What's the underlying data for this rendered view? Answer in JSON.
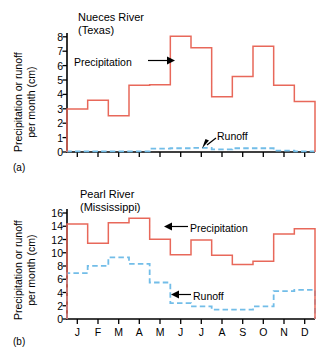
{
  "figure": {
    "panel_a_letter": "(a)",
    "panel_b_letter": "(b)"
  },
  "panel_a": {
    "title_line1": "Nueces River",
    "title_line2": "(Texas)",
    "ylabel_line1": "Precipitation or runoff",
    "ylabel_line2": "per month (cm)",
    "annotation_precipitation": "Precipitation",
    "annotation_runoff": "Runoff",
    "ytick_labels": [
      "0",
      "1",
      "2",
      "3",
      "4",
      "5",
      "6",
      "7",
      "8"
    ]
  },
  "panel_b": {
    "title_line1": "Pearl River",
    "title_line2": "(Mississippi)",
    "ylabel_line1": "Precipitation or runoff",
    "ylabel_line2": "per month (cm)",
    "annotation_precipitation": "Precipitation",
    "annotation_runoff": "Runoff",
    "ytick_labels": [
      "0",
      "2",
      "4",
      "6",
      "8",
      "10",
      "12",
      "14",
      "16"
    ],
    "xtick_labels": [
      "J",
      "F",
      "M",
      "A",
      "M",
      "J",
      "J",
      "A",
      "S",
      "O",
      "N",
      "D"
    ]
  },
  "colors": {
    "precipitation": "#e8685a",
    "runoff": "#72bde8",
    "axis": "#000000",
    "background": "#ffffff"
  },
  "chart_data": [
    {
      "id": "panel-a",
      "type": "line",
      "step": true,
      "title": "Nueces River (Texas)",
      "xlabel": "",
      "ylabel": "Precipitation or runoff per month (cm)",
      "categories": [
        "J",
        "F",
        "M",
        "A",
        "M",
        "J",
        "J",
        "A",
        "S",
        "O",
        "N",
        "D"
      ],
      "xtick_labels_shown": false,
      "ylim": [
        0,
        8.8
      ],
      "yticks": [
        0,
        1,
        2,
        3,
        4,
        5,
        6,
        7,
        8
      ],
      "grid": false,
      "legend": "inline-annotations",
      "series": [
        {
          "name": "Precipitation",
          "color": "#e8685a",
          "style": "solid",
          "values": [
            3.2,
            3.85,
            2.7,
            4.95,
            5.0,
            8.6,
            7.75,
            4.1,
            5.6,
            7.85,
            4.95,
            3.75
          ]
        },
        {
          "name": "Runoff",
          "color": "#72bde8",
          "style": "dashed",
          "values": [
            0.05,
            0.05,
            0.05,
            0.05,
            0.25,
            0.28,
            0.3,
            0.2,
            0.28,
            0.28,
            0.1,
            0.05
          ]
        }
      ]
    },
    {
      "id": "panel-b",
      "type": "line",
      "step": true,
      "title": "Pearl River (Mississippi)",
      "xlabel": "",
      "ylabel": "Precipitation or runoff per month (cm)",
      "categories": [
        "J",
        "F",
        "M",
        "A",
        "M",
        "J",
        "J",
        "A",
        "S",
        "O",
        "N",
        "D"
      ],
      "xtick_labels_shown": true,
      "ylim": [
        0,
        16.5
      ],
      "yticks": [
        0,
        2,
        4,
        6,
        8,
        10,
        12,
        14,
        16
      ],
      "grid": false,
      "legend": "inline-annotations",
      "series": [
        {
          "name": "Precipitation",
          "color": "#e8685a",
          "style": "solid",
          "values": [
            14.3,
            11.4,
            14.5,
            15.2,
            12.0,
            9.7,
            11.9,
            9.6,
            8.2,
            8.7,
            12.8,
            13.6
          ]
        },
        {
          "name": "Runoff",
          "color": "#72bde8",
          "style": "dashed",
          "values": [
            6.9,
            8.0,
            9.3,
            8.3,
            5.5,
            2.4,
            1.9,
            1.4,
            1.4,
            1.9,
            4.2,
            4.4
          ]
        }
      ]
    }
  ]
}
